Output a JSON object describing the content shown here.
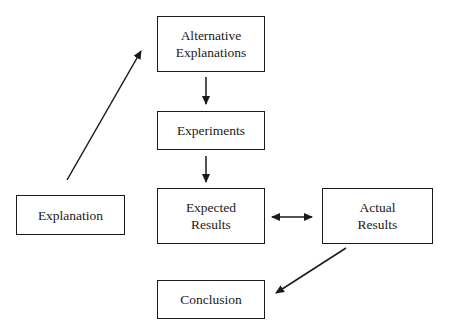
{
  "diagram": {
    "nodes": {
      "alternative_explanations": {
        "lines": [
          "Alternative",
          "Explanations"
        ]
      },
      "experiments": {
        "lines": [
          "Experiments"
        ]
      },
      "expected_results": {
        "lines": [
          "Expected",
          "Results"
        ]
      },
      "actual_results": {
        "lines": [
          "Actual",
          "Results"
        ]
      },
      "explanation": {
        "lines": [
          "Explanation"
        ]
      },
      "conclusion": {
        "lines": [
          "Conclusion"
        ]
      }
    },
    "edges": [
      {
        "from": "explanation",
        "to": "alternative_explanations",
        "type": "arrow"
      },
      {
        "from": "alternative_explanations",
        "to": "experiments",
        "type": "arrow"
      },
      {
        "from": "experiments",
        "to": "expected_results",
        "type": "arrow"
      },
      {
        "from": "expected_results",
        "to": "actual_results",
        "type": "bidirectional"
      },
      {
        "from": "actual_results",
        "to": "conclusion",
        "type": "arrow"
      }
    ],
    "line_color": "#1a1a1a"
  }
}
